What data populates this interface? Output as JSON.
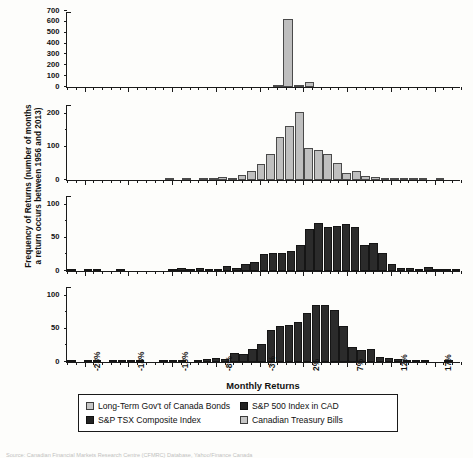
{
  "chart_data": {
    "type": "bar",
    "title": "",
    "xlabel": "Monthly Returns",
    "ylabel": "Frequency of Returns (number of months a return occurs between 1956 and 2013)",
    "ylabel_line1": "Frequency of Returns (number of months",
    "ylabel_line2": "a return occurs between 1956 and 2013)",
    "layout": "4 stacked histogram panels sharing one x axis",
    "grid": false,
    "legend_position": "below x-axis, boxed, two columns",
    "xlim": [
      -25.5,
      19.5
    ],
    "bin_width": 1,
    "xticks": [
      "-23%",
      "-18%",
      "-13%",
      "-8%",
      "-3%",
      "2%",
      "7%",
      "12%",
      "17%"
    ],
    "xtick_values": [
      -23,
      -18,
      -13,
      -8,
      -3,
      2,
      7,
      12,
      17
    ],
    "panels": [
      {
        "name": "Canadian Treasury Bills",
        "series_key": "tbills",
        "color": "#bfbfbf",
        "style": "light",
        "ylim": [
          0,
          700
        ],
        "yticks": [
          0,
          100,
          200,
          300,
          400,
          500,
          600,
          700
        ],
        "bin_centers": [
          -25,
          -24,
          -23,
          -22,
          -21,
          -20,
          -19,
          -18,
          -17,
          -16,
          -15,
          -14,
          -13,
          -12,
          -11,
          -10,
          -9,
          -8,
          -7,
          -6,
          -5,
          -4,
          -3,
          -2,
          -1,
          0,
          1,
          2,
          3,
          4,
          5,
          6,
          7,
          8,
          9,
          10,
          11,
          12,
          13,
          14,
          15,
          16,
          17,
          18,
          19
        ],
        "values": [
          0,
          0,
          0,
          0,
          0,
          0,
          0,
          0,
          0,
          0,
          0,
          0,
          0,
          0,
          0,
          0,
          0,
          0,
          0,
          0,
          0,
          0,
          0,
          0,
          8,
          630,
          20,
          45,
          0,
          0,
          0,
          0,
          0,
          0,
          0,
          0,
          0,
          0,
          0,
          0,
          0,
          0,
          0,
          0,
          0
        ]
      },
      {
        "name": "Long-Term Gov't of Canada Bonds",
        "series_key": "bonds",
        "color": "#bfbfbf",
        "style": "light",
        "ylim": [
          0,
          230
        ],
        "yticks": [
          0,
          100,
          200
        ],
        "bin_centers": [
          -25,
          -24,
          -23,
          -22,
          -21,
          -20,
          -19,
          -18,
          -17,
          -16,
          -15,
          -14,
          -13,
          -12,
          -11,
          -10,
          -9,
          -8,
          -7,
          -6,
          -5,
          -4,
          -3,
          -2,
          -1,
          0,
          1,
          2,
          3,
          4,
          5,
          6,
          7,
          8,
          9,
          10,
          11,
          12,
          13,
          14,
          15,
          16,
          17,
          18,
          19
        ],
        "values": [
          0,
          0,
          0,
          0,
          0,
          0,
          0,
          0,
          0,
          0,
          0,
          0,
          0,
          2,
          0,
          4,
          0,
          6,
          3,
          9,
          5,
          14,
          26,
          48,
          78,
          130,
          163,
          205,
          96,
          90,
          80,
          52,
          22,
          28,
          12,
          8,
          6,
          4,
          5,
          3,
          2,
          0,
          2,
          0,
          0
        ]
      },
      {
        "name": "S&P 500 Index in CAD",
        "series_key": "sp500",
        "color": "#2b2b2b",
        "style": "dark",
        "ylim": [
          0,
          115
        ],
        "yticks": [
          0,
          50,
          100
        ],
        "bin_centers": [
          -25,
          -24,
          -23,
          -22,
          -21,
          -20,
          -19,
          -18,
          -17,
          -16,
          -15,
          -14,
          -13,
          -12,
          -11,
          -10,
          -9,
          -8,
          -7,
          -6,
          -5,
          -4,
          -3,
          -2,
          -1,
          0,
          1,
          2,
          3,
          4,
          5,
          6,
          7,
          8,
          9,
          10,
          11,
          12,
          13,
          14,
          15,
          16,
          17,
          18,
          19
        ],
        "values": [
          2,
          0,
          1,
          1,
          0,
          0,
          1,
          0,
          0,
          0,
          0,
          0,
          0,
          1,
          4,
          3,
          4,
          3,
          2,
          8,
          5,
          11,
          13,
          25,
          27,
          27,
          30,
          40,
          63,
          73,
          67,
          68,
          71,
          67,
          40,
          42,
          27,
          10,
          4,
          5,
          3,
          6,
          3,
          3,
          2
        ]
      },
      {
        "name": "S&P TSX Composite Index",
        "series_key": "tsx",
        "color": "#2b2b2b",
        "style": "dark",
        "ylim": [
          0,
          115
        ],
        "yticks": [
          0,
          50,
          100
        ],
        "bin_centers": [
          -25,
          -24,
          -23,
          -22,
          -21,
          -20,
          -19,
          -18,
          -17,
          -16,
          -15,
          -14,
          -13,
          -12,
          -11,
          -10,
          -9,
          -8,
          -7,
          -6,
          -5,
          -4,
          -3,
          -2,
          -1,
          0,
          1,
          2,
          3,
          4,
          5,
          6,
          7,
          8,
          9,
          10,
          11,
          12,
          13,
          14,
          15,
          16,
          17,
          18,
          19
        ],
        "values": [
          1,
          0,
          2,
          2,
          0,
          1,
          2,
          2,
          1,
          0,
          0,
          3,
          2,
          1,
          0,
          3,
          5,
          6,
          4,
          14,
          12,
          19,
          28,
          48,
          54,
          56,
          61,
          74,
          86,
          86,
          78,
          55,
          23,
          18,
          19,
          7,
          6,
          4,
          3,
          2,
          1,
          0,
          0,
          1,
          0
        ]
      }
    ]
  },
  "legend": {
    "entries": [
      {
        "label": "Long-Term Gov't of Canada Bonds",
        "style": "light"
      },
      {
        "label": "S&P 500 Index in CAD",
        "style": "dark"
      },
      {
        "label": "S&P TSX Composite Index",
        "style": "dark"
      },
      {
        "label": "Canadian Treasury Bills",
        "style": "light"
      }
    ]
  },
  "source": "Source: Canadian Financial Markets Research Centre (CFMRC) Database, Yahoo!Finance Canada"
}
